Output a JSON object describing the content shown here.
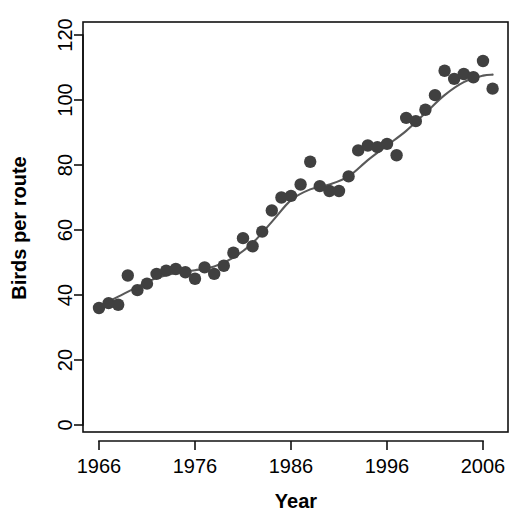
{
  "chart_data": {
    "type": "scatter",
    "title": "",
    "xlabel": "Year",
    "ylabel": "Birds per route",
    "xlim": [
      1965,
      2008
    ],
    "ylim": [
      0,
      125
    ],
    "xticks": [
      1966,
      1976,
      1986,
      1996,
      2006
    ],
    "xticklabels": [
      "1966",
      "1976",
      "1986",
      "1996",
      "2006"
    ],
    "yticks": [
      0,
      20,
      40,
      60,
      80,
      100,
      120
    ],
    "yticklabels": [
      "0",
      "20",
      "40",
      "60",
      "80",
      "100",
      "120"
    ],
    "grid": false,
    "legend": null,
    "point_color": "#404040",
    "line_color": "#595959",
    "axis_color": "#111111",
    "background": "#ffffff",
    "series": [
      {
        "name": "Birds per route",
        "kind": "points",
        "x": [
          1966,
          1967,
          1968,
          1969,
          1970,
          1971,
          1972,
          1973,
          1974,
          1975,
          1976,
          1977,
          1978,
          1979,
          1980,
          1981,
          1982,
          1983,
          1984,
          1985,
          1986,
          1987,
          1988,
          1989,
          1990,
          1991,
          1992,
          1993,
          1994,
          1995,
          1996,
          1997,
          1998,
          1999,
          2000,
          2001,
          2002,
          2003,
          2004,
          2005,
          2006,
          2007
        ],
        "y": [
          36.0,
          37.5,
          37.0,
          46.0,
          41.5,
          43.5,
          46.5,
          47.5,
          48.0,
          47.0,
          45.0,
          48.5,
          46.5,
          49.0,
          53.0,
          57.5,
          55.0,
          59.5,
          66.0,
          70.0,
          70.5,
          74.0,
          81.0,
          73.5,
          72.0,
          72.0,
          76.5,
          84.5,
          86.0,
          85.5,
          86.5,
          83.0,
          94.5,
          93.5,
          97.0,
          101.5,
          109.0,
          106.5,
          108.0,
          107.0,
          112.0,
          103.5
        ]
      },
      {
        "name": "loess smoother",
        "kind": "line",
        "x": [
          1966,
          1968,
          1970,
          1972,
          1974,
          1976,
          1978,
          1980,
          1982,
          1984,
          1986,
          1988,
          1990,
          1992,
          1994,
          1996,
          1998,
          2000,
          2002,
          2004,
          2006,
          2007
        ],
        "y": [
          36.5,
          39.5,
          42.5,
          45.2,
          46.8,
          47.6,
          48.8,
          51.5,
          56.0,
          62.5,
          69.2,
          72.5,
          74.0,
          76.5,
          81.5,
          86.0,
          90.5,
          96.0,
          101.5,
          105.5,
          107.5,
          107.8
        ]
      }
    ]
  },
  "labels": {
    "ylabel": "Birds per route",
    "xlabel": "Year"
  }
}
